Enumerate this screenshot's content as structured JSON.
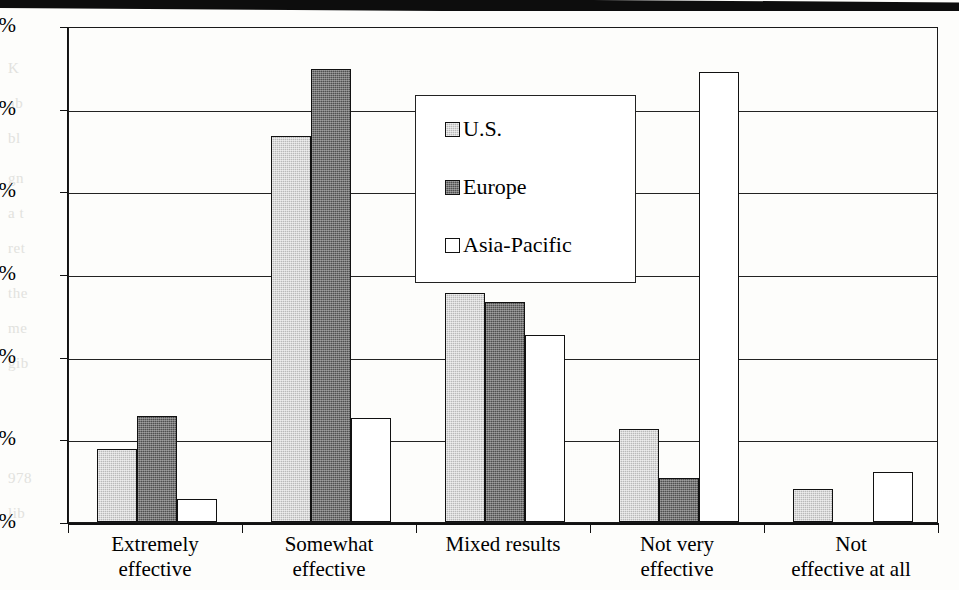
{
  "chart_data": {
    "type": "bar",
    "title": "",
    "xlabel": "",
    "ylabel": "",
    "ylim": [
      0,
      60
    ],
    "y_tick_labels": [
      "0%",
      "10%",
      "20%",
      "30%",
      "40%",
      "50%",
      "60%"
    ],
    "y_tick_values": [
      0,
      10,
      20,
      30,
      40,
      50,
      60
    ],
    "grid": true,
    "legend_position": "inside-upper-center",
    "categories": [
      "Extremely effective",
      "Somewhat effective",
      "Mixed results",
      "Not very effective",
      "Not effective at all"
    ],
    "category_lines": [
      [
        "Extremely",
        "effective"
      ],
      [
        "Somewhat",
        "effective"
      ],
      [
        "Mixed results",
        ""
      ],
      [
        "Not very",
        "effective"
      ],
      [
        "Not",
        "effective at all"
      ]
    ],
    "series": [
      {
        "name": "U.S.",
        "color": "#b9b9b9",
        "values": [
          8.8,
          46.7,
          27.7,
          11.3,
          4.0
        ]
      },
      {
        "name": "Europe",
        "color": "#4f4f4f",
        "values": [
          12.8,
          54.8,
          26.6,
          5.3,
          0.0
        ]
      },
      {
        "name": "Asia-Pacific",
        "color": "#ffffff",
        "values": [
          2.8,
          12.6,
          22.6,
          54.4,
          6.0
        ]
      }
    ]
  },
  "legend": {
    "items": [
      {
        "label": "U.S."
      },
      {
        "label": "Europe"
      },
      {
        "label": "Asia-Pacific"
      }
    ]
  },
  "page_bleed": {
    "fragments": [
      "K",
      "ab",
      "bl",
      "gn",
      "a t",
      "ret",
      "the",
      "me",
      "gib",
      "978",
      "lib"
    ]
  }
}
